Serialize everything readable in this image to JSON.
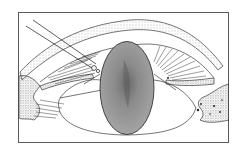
{
  "figure": {
    "type": "medical line illustration",
    "colors": {
      "background": "#ffffff",
      "frame": "#5a5a5a",
      "line": "#3a3a3a",
      "lens_fill": "#9a9a9a",
      "lens_core": "#6e6e6e",
      "stipple": "#7a7a7a"
    },
    "labels": []
  }
}
